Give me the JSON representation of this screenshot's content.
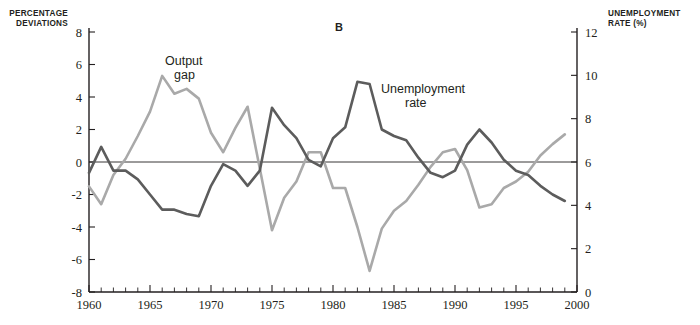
{
  "panel": {
    "letter": "B"
  },
  "axes": {
    "left_title_line1": "PERCENTAGE",
    "left_title_line2": "DEVIATIONS",
    "right_title_line1": "UNEMPLOYMENT",
    "right_title_line2": "RATE (%)",
    "left_ticks": [
      8,
      6,
      4,
      2,
      0,
      -2,
      -4,
      -6,
      -8
    ],
    "right_ticks": [
      12,
      10,
      8,
      6,
      4,
      2,
      0
    ],
    "x_ticks_labeled": [
      1960,
      1965,
      1970,
      1975,
      1980,
      1985,
      1990,
      1995,
      2000
    ],
    "left_range": [
      -8,
      8
    ],
    "right_range": [
      0,
      12
    ],
    "x_range": [
      1960,
      2000
    ],
    "x_tick_step": 1,
    "grid": false
  },
  "series_labels": {
    "output_gap_line1": "Output",
    "output_gap_line2": "gap",
    "unemployment_line1": "Unemployment",
    "unemployment_line2": "rate"
  },
  "colors": {
    "output_gap": "#a9a9a9",
    "unemployment": "#5c5c5c",
    "axis": "#231f20",
    "background": "#ffffff"
  },
  "chart_data": {
    "type": "line",
    "title": "B",
    "xlabel": "",
    "ylabel": "PERCENTAGE DEVIATIONS",
    "y2label": "UNEMPLOYMENT RATE (%)",
    "xlim": [
      1960,
      2000
    ],
    "ylim": [
      -8,
      8
    ],
    "y2lim": [
      0,
      12
    ],
    "legend_position": "inline-annotations",
    "grid": false,
    "x": [
      1960,
      1961,
      1962,
      1963,
      1964,
      1965,
      1966,
      1967,
      1968,
      1969,
      1970,
      1971,
      1972,
      1973,
      1974,
      1975,
      1976,
      1977,
      1978,
      1979,
      1980,
      1981,
      1982,
      1983,
      1984,
      1985,
      1986,
      1987,
      1988,
      1989,
      1990,
      1991,
      1992,
      1993,
      1994,
      1995,
      1996,
      1997,
      1998,
      1999
    ],
    "series": [
      {
        "name": "Output gap",
        "axis": "left",
        "units": "percent deviation",
        "color": "#a9a9a9",
        "values": [
          -1.5,
          -2.6,
          -0.8,
          0.2,
          1.6,
          3.1,
          5.3,
          4.2,
          4.5,
          3.9,
          1.8,
          0.6,
          2.1,
          3.4,
          -0.4,
          -4.2,
          -2.2,
          -1.2,
          0.6,
          0.6,
          -1.6,
          -1.6,
          -4.0,
          -6.7,
          -4.1,
          -3.0,
          -2.4,
          -1.4,
          -0.3,
          0.6,
          0.8,
          -0.5,
          -2.8,
          -2.6,
          -1.6,
          -1.2,
          -0.6,
          0.4,
          1.1,
          1.7
        ]
      },
      {
        "name": "Unemployment rate",
        "axis": "right",
        "units": "percent",
        "color": "#5c5c5c",
        "values": [
          5.5,
          6.7,
          5.6,
          5.6,
          5.2,
          4.5,
          3.8,
          3.8,
          3.6,
          3.5,
          4.9,
          5.9,
          5.6,
          4.9,
          5.6,
          8.5,
          7.7,
          7.1,
          6.1,
          5.8,
          7.1,
          7.6,
          9.7,
          9.6,
          7.5,
          7.2,
          7.0,
          6.2,
          5.5,
          5.3,
          5.6,
          6.8,
          7.5,
          6.9,
          6.1,
          5.6,
          5.4,
          4.9,
          4.5,
          4.2
        ]
      }
    ]
  }
}
